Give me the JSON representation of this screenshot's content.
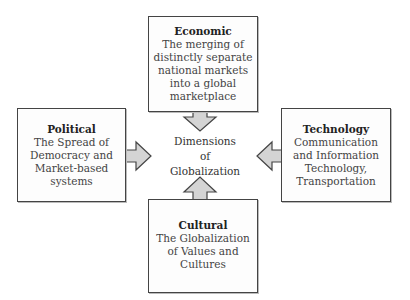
{
  "center": {
    "label": "Dimensions\nof\nGlobalization"
  },
  "boxes": {
    "economic": {
      "title": "Economic",
      "description": "The merging of\ndistinctly separate\nnational markets\ninto a global\nmarketplace"
    },
    "political": {
      "title": "Political",
      "description": "The Spread of\nDemocracy and\nMarket-based\nsystems"
    },
    "technology": {
      "title": "Technology",
      "description": "Communication\nand Information\nTechnology,\nTransportation"
    },
    "cultural": {
      "title": "Cultural",
      "description": "The Globalization\nof Values and\nCultures"
    }
  },
  "colors": {
    "arrow_fill": "#d4d4d4",
    "arrow_stroke": "#444444",
    "border": "#444444"
  }
}
